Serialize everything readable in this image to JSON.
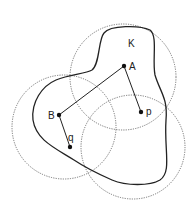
{
  "diagram": {
    "region_label": "K",
    "points": [
      {
        "id": "A",
        "label": "A"
      },
      {
        "id": "p",
        "label": "p"
      },
      {
        "id": "B",
        "label": "B"
      },
      {
        "id": "q",
        "label": "q"
      }
    ],
    "circles": 3,
    "colors": {
      "stroke": "#222222",
      "dotted": "#555555"
    }
  }
}
